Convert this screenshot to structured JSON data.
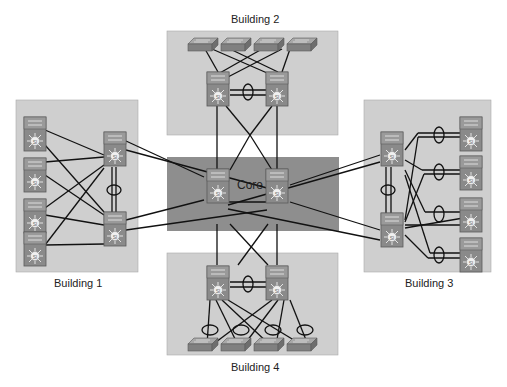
{
  "zones": {
    "building1": {
      "label": "Building 1"
    },
    "building2": {
      "label": "Building 2"
    },
    "building3": {
      "label": "Building 3"
    },
    "building4": {
      "label": "Building 4"
    },
    "core": {
      "label": "Core"
    }
  },
  "colors": {
    "building_bg": "#cfcfcf",
    "core_bg": "#8e8e8e",
    "switch_body": "#8a8a8a",
    "switch_dark": "#6e6e6e",
    "line": "#111111"
  },
  "icons": {
    "multilayer_switch": "multilayer-switch-icon",
    "access_switch": "workgroup-switch-icon",
    "etherchannel": "etherchannel-ellipse"
  }
}
